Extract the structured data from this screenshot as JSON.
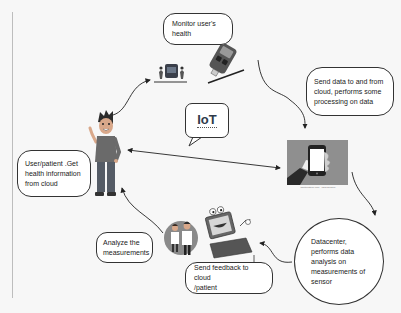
{
  "diagram": {
    "center_label": "IoT",
    "nodes": [
      {
        "id": "monitor",
        "label": "Monitor user's health",
        "lines": [
          "Monitor user's",
          "health"
        ]
      },
      {
        "id": "send",
        "label": "Send data to and from cloud, performs some processing on data",
        "lines": [
          "Send data to and from",
          "cloud, performs some",
          "processing on data"
        ]
      },
      {
        "id": "datacenter",
        "label": "Datacenter, performs data analysis on measurements of sensor",
        "lines": [
          "Datacenter,",
          "performs data",
          "analysis on",
          "measurements of",
          "sensor"
        ]
      },
      {
        "id": "feedback",
        "label": "Send feedback to cloud /patient",
        "lines": [
          "Send feedback to cloud",
          "/patient"
        ]
      },
      {
        "id": "analyze",
        "label": "Analyze the measurements",
        "lines": [
          "Analyze the",
          "measurements"
        ]
      },
      {
        "id": "user",
        "label": "User/patient .Get health information from cloud",
        "lines": [
          "User/patient .Get",
          "health information",
          "from cloud"
        ]
      }
    ],
    "images": [
      {
        "id": "user-figure",
        "icon": "person-waving-icon"
      },
      {
        "id": "sensor-device",
        "icon": "medical-sensor-icon"
      },
      {
        "id": "glucometer",
        "icon": "glucometer-icon"
      },
      {
        "id": "smartphone",
        "icon": "smartphone-in-hand-icon",
        "caption": "shutterstock.com · 1234567890"
      },
      {
        "id": "laptop",
        "icon": "laptop-character-icon"
      },
      {
        "id": "doctors",
        "icon": "doctors-icon"
      }
    ],
    "edges": [
      {
        "from": "user",
        "to": "sensor-device",
        "style": "curved-arrow"
      },
      {
        "from": "glucometer",
        "to": "smartphone",
        "style": "curved-arrow"
      },
      {
        "from": "smartphone",
        "to": "datacenter",
        "style": "curved-arrow"
      },
      {
        "from": "datacenter",
        "to": "laptop",
        "style": "curved-arrow"
      },
      {
        "from": "doctors",
        "to": "user",
        "style": "curved-arrow"
      },
      {
        "from": "user",
        "to": "smartphone",
        "style": "bidirectional-straight-arrow"
      }
    ],
    "colors": {
      "background": "#f7f7f7",
      "line": "#333333",
      "bubble_fill": "#ffffff",
      "phone_panel": "#8f8f8f",
      "iot_text": "#2f3b4a"
    }
  }
}
